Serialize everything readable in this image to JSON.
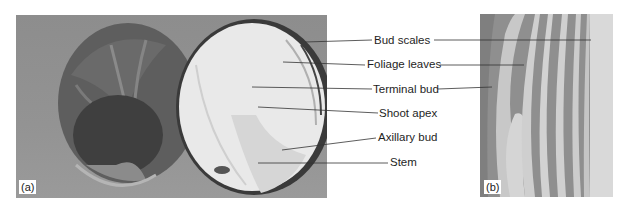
{
  "figure": {
    "panels": [
      {
        "id": "a",
        "tag": "(a)",
        "description": "Brussels sprout bud: whole exterior and longitudinal section"
      },
      {
        "id": "b",
        "tag": "(b)",
        "description": "Micrograph longitudinal section of shoot apex with leaf primordia"
      }
    ],
    "labels": [
      {
        "text": "Bud scales"
      },
      {
        "text": "Foliage leaves"
      },
      {
        "text": "Terminal bud"
      },
      {
        "text": "Shoot apex"
      },
      {
        "text": "Axillary bud"
      },
      {
        "text": "Stem"
      }
    ],
    "colors": {
      "background_a": "#909090",
      "sprout_outer": "#555555",
      "sprout_cut": "#e6e6e6",
      "leader_line": "#333333"
    }
  }
}
